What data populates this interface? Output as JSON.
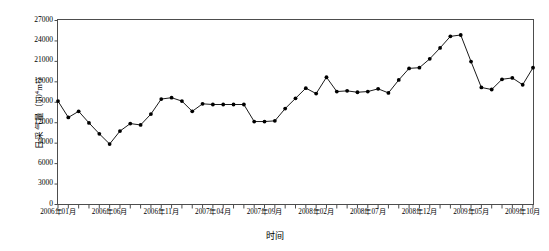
{
  "chart_data": {
    "type": "line",
    "title": "",
    "xlabel": "时间",
    "ylabel": "日采气量（10⁴m³）",
    "ylabel_main": "日采气量（10",
    "ylabel_sup": "4",
    "ylabel_tail": "m³）",
    "ylim": [
      0,
      27000
    ],
    "ytick_values": [
      0,
      3000,
      6000,
      9000,
      12000,
      15000,
      18000,
      21000,
      24000,
      27000
    ],
    "ytick_labels": [
      "0",
      "3000",
      "6000",
      "9000",
      "12000",
      "15000",
      "18000",
      "21000",
      "24000",
      "27000"
    ],
    "grid": false,
    "legend": null,
    "marker": "filled-circle",
    "line_color": "#000000",
    "marker_color": "#000000",
    "axis_color": "#4d4d4d",
    "background": "#ffffff",
    "xtick_labels": [
      "2006年01月",
      "2006年06月",
      "2006年11月",
      "2007年04月",
      "2007年09月",
      "2008年02月",
      "2008年07月",
      "2008年12月",
      "2009年05月",
      "2009年10月"
    ],
    "xtick_label_indices": [
      0,
      5,
      10,
      15,
      20,
      25,
      30,
      35,
      40,
      45
    ],
    "categories": [
      "2006年01月",
      "2006年02月",
      "2006年03月",
      "2006年04月",
      "2006年05月",
      "2006年06月",
      "2006年07月",
      "2006年08月",
      "2006年09月",
      "2006年10月",
      "2006年11月",
      "2006年12月",
      "2007年01月",
      "2007年02月",
      "2007年03月",
      "2007年04月",
      "2007年05月",
      "2007年06月",
      "2007年07月",
      "2007年08月",
      "2007年09月",
      "2007年10月",
      "2007年11月",
      "2007年12月",
      "2008年01月",
      "2008年02月",
      "2008年03月",
      "2008年04月",
      "2008年05月",
      "2008年06月",
      "2008年07月",
      "2008年08月",
      "2008年09月",
      "2008年10月",
      "2008年11月",
      "2008年12月",
      "2009年01月",
      "2009年02月",
      "2009年03月",
      "2009年04月",
      "2009年05月",
      "2009年06月",
      "2009年07月",
      "2009年08月",
      "2009年09月",
      "2009年10月",
      "2009年11月"
    ],
    "values": [
      15100,
      12700,
      13600,
      11900,
      10300,
      8800,
      10700,
      11800,
      11600,
      13200,
      15400,
      15600,
      15100,
      13600,
      14700,
      14600,
      14600,
      14600,
      14600,
      12100,
      12100,
      12200,
      14000,
      15500,
      17000,
      16200,
      18600,
      16500,
      16600,
      16400,
      16500,
      16900,
      16300,
      18200,
      19900,
      20000,
      21300,
      22900,
      24600,
      24800,
      20900,
      17100,
      16800,
      18300,
      18500,
      17500,
      20000
    ]
  }
}
